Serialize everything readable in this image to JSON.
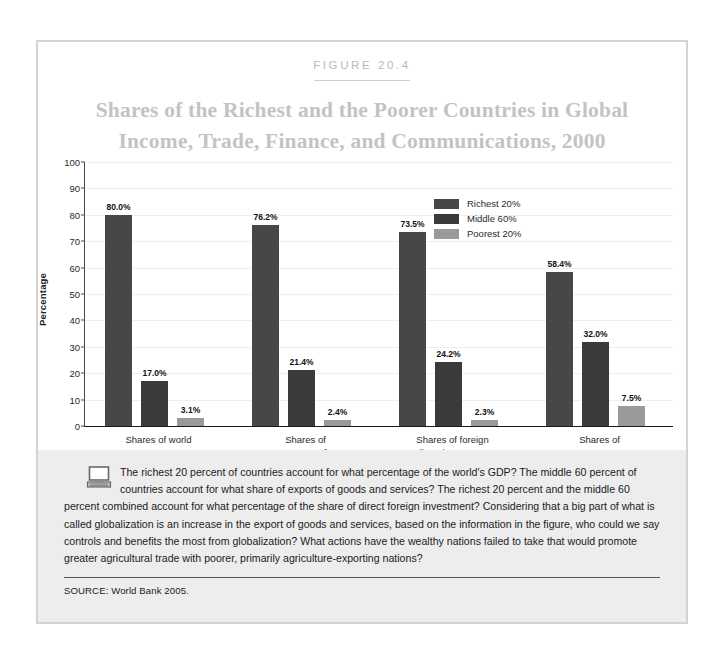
{
  "figure": {
    "number_label": "FIGURE 20.4",
    "title_line1": "Shares of the Richest and the Poorer Countries in Global",
    "title_line2": "Income, Trade, Finance, and Communications, 2000"
  },
  "caption": {
    "text": "The richest 20 percent of countries account for what percentage of the world's GDP? The middle 60 percent of countries account for what share of exports of goods and services? The richest 20 percent and the middle 60 percent combined account for what percentage of the share of direct foreign investment? Considering that a big part of what is called globalization is an increase in the export of goods and services, based on the information in the figure, who could we say controls and benefits the most from globalization? What actions have the wealthy nations failed to take that would promote greater agricultural trade with poorer, primarily agriculture-exporting nations?",
    "source": "SOURCE: World Bank 2005.",
    "icon": "computer-icon"
  },
  "chart_data": {
    "type": "bar",
    "title": "Shares of the Richest and the Poorer Countries in Global Income, Trade, Finance, and Communications, 2000",
    "xlabel": "",
    "ylabel": "Percentage",
    "ylim": [
      0,
      100
    ],
    "yticks": [
      0,
      10,
      20,
      30,
      40,
      50,
      60,
      70,
      80,
      90,
      100
    ],
    "grid": true,
    "legend_position": "top-right",
    "categories": [
      "Shares of world GDP",
      "Shares of exports of\ngoods and services",
      "Shares of foreign\ndirect investment",
      "Shares of Internet users"
    ],
    "series": [
      {
        "name": "Richest 20%",
        "color": "#474747",
        "values": [
          80.0,
          76.2,
          73.5,
          58.4
        ],
        "labels": [
          "80.0%",
          "76.2%",
          "73.5%",
          "58.4%"
        ]
      },
      {
        "name": "Middle 60%",
        "color": "#3a3a3a",
        "values": [
          17.0,
          21.4,
          24.2,
          32.0
        ],
        "labels": [
          "17.0%",
          "21.4%",
          "24.2%",
          "32.0%"
        ]
      },
      {
        "name": "Poorest 20%",
        "color": "#9a9a9a",
        "values": [
          3.1,
          2.4,
          2.3,
          7.5
        ],
        "labels": [
          "3.1%",
          "2.4%",
          "2.3%",
          "7.5%"
        ]
      }
    ]
  }
}
